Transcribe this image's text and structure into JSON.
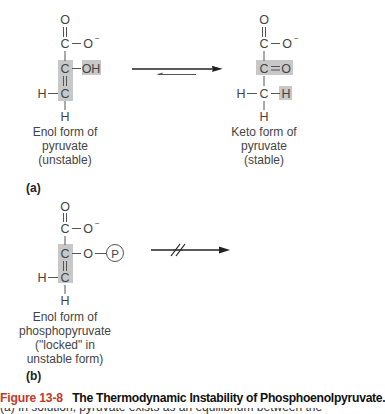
{
  "figure": {
    "number_label": "Figure 13-8",
    "title": "The Thermodynamic Instability of Phosphoenolpyruvate.",
    "caption_next_line_partial": "(a) In solution, pyruvate exists as an equilibrium between the enol and keto forms"
  },
  "panel_a": {
    "letter": "(a)",
    "left_molecule": {
      "name": "enol-pyruvate",
      "atoms": {
        "top_o": "O",
        "carboxyl_c": "C",
        "carboxylate_o": "O",
        "charge": "−",
        "alpha_c": "C",
        "oh": "OH",
        "beta_c": "C",
        "h_left": "H",
        "h_bottom": "H"
      },
      "label_lines": [
        "Enol form of",
        "pyruvate",
        "(unstable)"
      ]
    },
    "right_molecule": {
      "name": "keto-pyruvate",
      "atoms": {
        "top_o": "O",
        "carboxyl_c": "C",
        "carboxylate_o": "O",
        "charge": "−",
        "carbonyl_c": "C",
        "carbonyl_o": "O",
        "methyl_c": "C",
        "h_left": "H",
        "h_right": "H",
        "h_bottom": "H"
      },
      "label_lines": [
        "Keto form of",
        "pyruvate",
        "(stable)"
      ]
    },
    "arrow": {
      "type": "equilibrium",
      "favored_direction": "right"
    }
  },
  "panel_b": {
    "letter": "(b)",
    "molecule": {
      "name": "phosphoenolpyruvate",
      "atoms": {
        "top_o": "O",
        "carboxyl_c": "C",
        "carboxylate_o": "O",
        "charge": "−",
        "alpha_c": "C",
        "ester_o": "O",
        "phosphate": "P",
        "beta_c": "C",
        "h_left": "H",
        "h_bottom": "H"
      },
      "label_lines": [
        "Enol form of",
        "phosphopyruvate",
        "(\"locked\" in",
        "unstable form)"
      ]
    },
    "arrow": {
      "type": "blocked"
    }
  },
  "colors": {
    "highlight": "#c8c8c8",
    "ink": "#3a3a3a",
    "figure_number": "#c0392b"
  }
}
